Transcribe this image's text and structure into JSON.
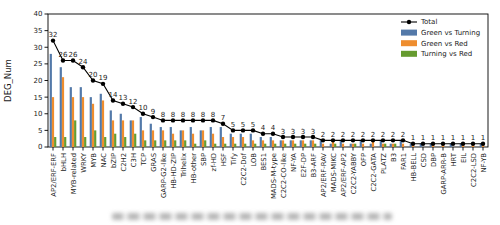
{
  "figure": {
    "background": "#ffffff",
    "frame_color": "#000000"
  },
  "chart_data": {
    "type": "bar",
    "title": "",
    "xlabel": "",
    "ylabel": "DEG_Num",
    "ylim": [
      0,
      40
    ],
    "yticks": [
      0,
      5,
      10,
      15,
      20,
      25,
      30,
      35,
      40
    ],
    "grid": false,
    "legend_position": "upper-right-inside",
    "x_tick_rotation": 90,
    "categories": [
      "AP2/ERF-ERF",
      "bHLH",
      "MYB-related",
      "WRKY",
      "MYB",
      "NAC",
      "bZIP",
      "C2H2",
      "C3H",
      "TCP",
      "GRAS",
      "GARP-G2-like",
      "HB-HD-ZIP",
      "Trihelix",
      "HB-other",
      "SBP",
      "zf-HD",
      "HSF",
      "Tify",
      "C2C2-Dof",
      "LOB",
      "BES1",
      "MADS-M-type",
      "C2C2-CO-like",
      "NF-YA",
      "E2F-DP",
      "B3-ARF",
      "AP2/ERF-RAV",
      "MADS-MIKC",
      "AP2/ERF-AP2",
      "C2C2-YABBY",
      "OFP",
      "C2C2-GATA",
      "PLATZ",
      "B3",
      "FAR1",
      "HB-BELL",
      "CSD",
      "DBP",
      "GARP-ARR-B",
      "HRT",
      "EIL",
      "C2C2-LSD",
      "NF-YB"
    ],
    "series": [
      {
        "name": "Green vs Turning",
        "color": "#5379a9",
        "values": [
          28,
          24,
          18,
          18,
          15,
          16,
          11,
          10,
          8,
          9,
          7,
          6,
          6,
          5,
          6,
          5,
          6,
          6,
          4,
          4,
          4,
          3,
          3,
          2,
          2,
          2,
          2,
          2,
          1,
          2,
          1,
          2,
          1,
          2,
          1,
          2,
          1,
          1,
          1,
          0,
          1,
          1,
          0,
          1
        ]
      },
      {
        "name": "Green vs Red",
        "color": "#ee8d2f",
        "values": [
          15,
          21,
          15,
          15,
          13,
          14,
          8,
          8,
          8,
          5,
          5,
          5,
          4,
          5,
          4,
          5,
          4,
          3,
          3,
          3,
          2,
          2,
          2,
          2,
          2,
          2,
          2,
          1,
          2,
          1,
          1,
          1,
          2,
          1,
          1,
          1,
          1,
          0,
          1,
          1,
          0,
          1,
          1,
          1
        ]
      },
      {
        "name": "Turning vs Red",
        "color": "#669b30",
        "values": [
          3,
          3,
          8,
          3,
          5,
          3,
          4,
          3,
          4,
          2,
          2,
          2,
          2,
          2,
          1,
          2,
          1,
          1,
          1,
          1,
          1,
          1,
          1,
          1,
          1,
          1,
          1,
          0,
          1,
          0,
          1,
          0,
          0,
          1,
          1,
          0,
          0,
          0,
          0,
          0,
          0,
          0,
          0,
          0
        ]
      }
    ],
    "total_line": {
      "name": "Total",
      "color": "#000000",
      "marker": "circle",
      "labels_shown": true,
      "values": [
        32,
        26,
        26,
        24,
        20,
        19,
        14,
        13,
        12,
        10,
        9,
        8,
        8,
        8,
        8,
        8,
        8,
        7,
        5,
        5,
        5,
        4,
        4,
        3,
        3,
        3,
        3,
        2,
        2,
        2,
        2,
        2,
        2,
        2,
        2,
        2,
        1,
        1,
        1,
        1,
        1,
        1,
        1,
        1
      ]
    }
  }
}
